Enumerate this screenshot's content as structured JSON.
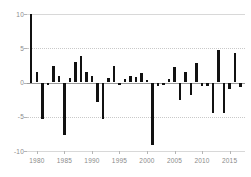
{
  "chart_data": {
    "type": "bar",
    "title": "",
    "subtitle": "",
    "xlabel": "",
    "ylabel": "",
    "grid": true,
    "legend": false,
    "legend_position": "none",
    "xlim": [
      1978.2,
      2017.8
    ],
    "ylim": [
      -10,
      10
    ],
    "yticks": [
      10,
      5,
      0,
      -5,
      -10
    ],
    "ytick_labels": [
      "10",
      "5",
      "0",
      "-5",
      "-10"
    ],
    "xticks": [
      1980,
      1985,
      1990,
      1995,
      2000,
      2005,
      2010,
      2015
    ],
    "xtick_labels": [
      "1980",
      "1985",
      "1990",
      "1995",
      "2000",
      "2005",
      "2010",
      "2015"
    ],
    "bar_color": "#111111",
    "categories": [
      1979,
      1980,
      1981,
      1982,
      1983,
      1984,
      1985,
      1986,
      1987,
      1988,
      1989,
      1990,
      1991,
      1992,
      1993,
      1994,
      1995,
      1996,
      1997,
      1998,
      1999,
      2000,
      2001,
      2002,
      2003,
      2004,
      2005,
      2006,
      2007,
      2008,
      2009,
      2010,
      2011,
      2012,
      2013,
      2014,
      2015,
      2016,
      2017
    ],
    "values": [
      10.0,
      1.6,
      -5.4,
      -0.4,
      2.4,
      1.0,
      -7.6,
      0.6,
      3.0,
      3.8,
      1.6,
      0.9,
      -2.9,
      -5.3,
      0.6,
      2.4,
      -0.3,
      0.5,
      1.0,
      0.8,
      1.4,
      0.4,
      -9.1,
      -0.5,
      -0.4,
      0.5,
      2.2,
      -2.6,
      1.5,
      -1.8,
      2.8,
      -0.5,
      -0.5,
      -4.4,
      4.8,
      -4.4,
      -1.0,
      4.3,
      -0.6
    ],
    "series": [
      {
        "name": "annual value",
        "values": [
          10.0,
          1.6,
          -5.4,
          -0.4,
          2.4,
          1.0,
          -7.6,
          0.6,
          3.0,
          3.8,
          1.6,
          0.9,
          -2.9,
          -5.3,
          0.6,
          2.4,
          -0.3,
          0.5,
          1.0,
          0.8,
          1.4,
          0.4,
          -9.1,
          -0.5,
          -0.4,
          0.5,
          2.2,
          -2.6,
          1.5,
          -1.8,
          2.8,
          -0.5,
          -0.5,
          -4.4,
          4.8,
          -4.4,
          -1.0,
          4.3,
          -0.6
        ]
      }
    ]
  },
  "axis": {
    "y_labels": [
      "10",
      "5",
      "0",
      "-5",
      "-10"
    ],
    "x_labels": [
      "1980",
      "1985",
      "1990",
      "1995",
      "2000",
      "2005",
      "2010",
      "2015"
    ]
  },
  "colors": {
    "bar": "#111111",
    "grid": "#c9c9c9",
    "zero_line": "#9a9a9a",
    "tick_text": "#8a8a8a",
    "background": "#ffffff"
  }
}
